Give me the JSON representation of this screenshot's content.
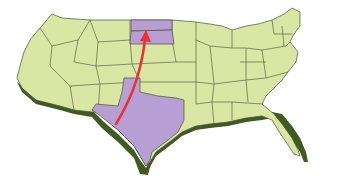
{
  "map": {
    "subject": "United States map, 3D extruded style",
    "colors": {
      "land": "#d9e6a4",
      "border": "#4a4f3a",
      "shadow": "#3f5a22",
      "highlight": "#b79fd4",
      "arrow": "#e8313a",
      "background": "#ffffff"
    },
    "highlighted_states": [
      "Texas",
      "South Dakota",
      "North Dakota"
    ],
    "arrow": {
      "from": "Texas",
      "to": "South Dakota"
    }
  }
}
